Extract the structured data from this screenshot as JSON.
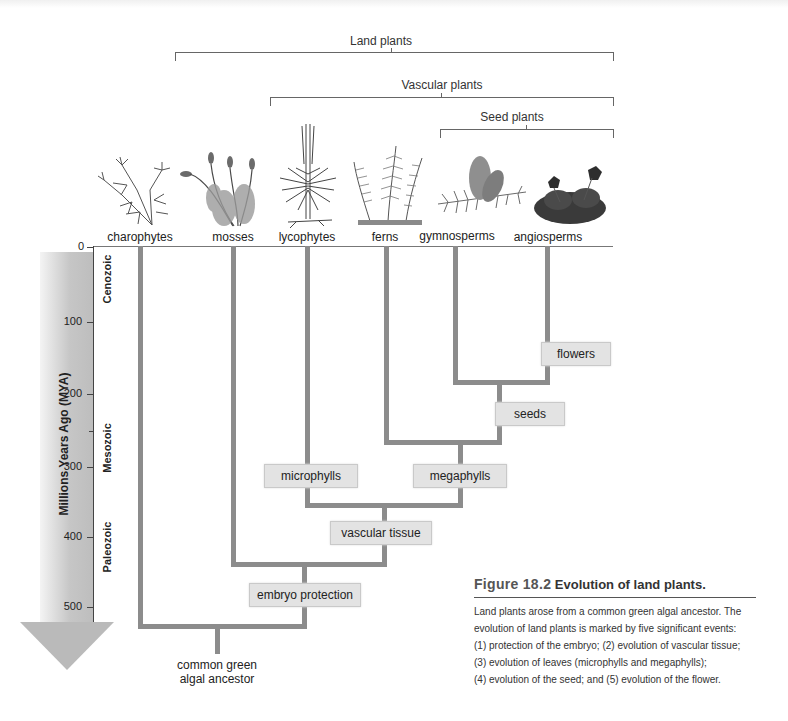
{
  "groups": {
    "land_plants": "Land plants",
    "vascular_plants": "Vascular plants",
    "seed_plants": "Seed plants"
  },
  "taxa": [
    {
      "name": "charophytes",
      "icon": "charophyte-illustration"
    },
    {
      "name": "mosses",
      "icon": "moss-illustration"
    },
    {
      "name": "lycophytes",
      "icon": "lycophyte-illustration"
    },
    {
      "name": "ferns",
      "icon": "fern-illustration"
    },
    {
      "name": "gymnosperms",
      "icon": "gymnosperm-cone-illustration"
    },
    {
      "name": "angiosperms",
      "icon": "angiosperm-flower-illustration"
    }
  ],
  "axis": {
    "title": "Millions Years Ago (MYA)",
    "ticks": [
      "0",
      "100",
      "200",
      "300",
      "400",
      "500"
    ],
    "eras": [
      "Cenozoic",
      "Mesozoic",
      "Paleozoic"
    ]
  },
  "events": {
    "flowers": "flowers",
    "seeds": "seeds",
    "microphylls": "microphylls",
    "megaphylls": "megaphylls",
    "vascular_tissue": "vascular tissue",
    "embryo_protection": "embryo protection"
  },
  "ancestor": {
    "line1": "common green",
    "line2": "algal ancestor"
  },
  "figure": {
    "number": "Figure 18.2",
    "title": "Evolution of land plants.",
    "caption": [
      "Land plants arose from a common green algal ancestor. The",
      "evolution of land plants is marked by five significant events:",
      "(1) protection of the embryo; (2) evolution of vascular tissue;",
      "(3) evolution of leaves (microphylls and megaphylls);",
      "(4) evolution of the seed; and (5) evolution of the flower."
    ]
  },
  "colors": {
    "branch": "#8c8c8c",
    "event_box": "#e3e3e3",
    "axis_arrow": "#bdbdbd"
  }
}
